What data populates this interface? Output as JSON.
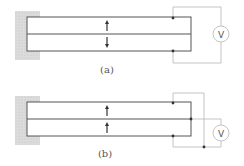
{
  "figure": {
    "panels": [
      {
        "label": "(a)",
        "description": "Cantilever bimorph, layers polarized in opposite directions, voltmeter across outer electrodes",
        "top_arrow": "up",
        "bottom_arrow": "down",
        "meter_symbol": "V"
      },
      {
        "label": "(b)",
        "description": "Cantilever bimorph, layers polarized in same direction, voltmeter between outer electrodes (joined) and middle electrode",
        "top_arrow": "up",
        "bottom_arrow": "up",
        "meter_symbol": "V"
      }
    ],
    "colors": {
      "wall_fill": "#d8d8d8",
      "beam_stroke": "#555555",
      "wire_stroke": "#b0b0b0",
      "node": "#333333"
    }
  }
}
